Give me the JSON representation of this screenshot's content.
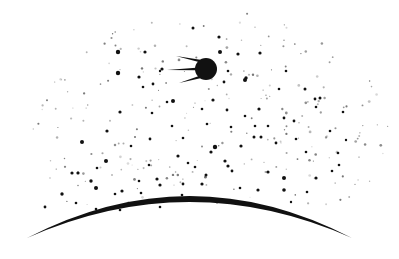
{
  "scene": {
    "width": 399,
    "height": 259,
    "background": "#ffffff",
    "ink_color": "#111111"
  },
  "satellite": {
    "name": "sputnik",
    "cx": 206,
    "cy": 69,
    "r": 11,
    "antennas": [
      {
        "x1": 200,
        "y1": 61,
        "x2": 176,
        "y2": 56
      },
      {
        "x1": 196,
        "y1": 69,
        "x2": 167,
        "y2": 70
      },
      {
        "x1": 200,
        "y1": 77,
        "x2": 179,
        "y2": 83
      }
    ]
  },
  "earth_horizon": {
    "x_left": 27,
    "x_right": 352,
    "y_ends": 238,
    "y_peak": 196,
    "thickness": 6
  },
  "stars_bright": [
    [
      118,
      52,
      2.2
    ],
    [
      145,
      52,
      1.6
    ],
    [
      162,
      69,
      1.6
    ],
    [
      143,
      87,
      1.3
    ],
    [
      118,
      73,
      2.2
    ],
    [
      139,
      77,
      1.6
    ],
    [
      153,
      84,
      1.4
    ],
    [
      160,
      71,
      1.2
    ],
    [
      173,
      101,
      2.0
    ],
    [
      193,
      28,
      1.5
    ],
    [
      219,
      37,
      1.6
    ],
    [
      220,
      52,
      2.0
    ],
    [
      238,
      54,
      1.6
    ],
    [
      260,
      53,
      1.6
    ],
    [
      246,
      78,
      1.7
    ],
    [
      245,
      80,
      2.0
    ],
    [
      224,
      82,
      1.4
    ],
    [
      228,
      71,
      1.3
    ],
    [
      286,
      71,
      1.3
    ],
    [
      305,
      89,
      1.5
    ],
    [
      320,
      98,
      1.5
    ],
    [
      315,
      99,
      1.4
    ],
    [
      279,
      89,
      1.3
    ],
    [
      213,
      100,
      1.6
    ],
    [
      227,
      110,
      1.4
    ],
    [
      202,
      109,
      1.3
    ],
    [
      259,
      109,
      1.6
    ],
    [
      316,
      107,
      1.3
    ],
    [
      284,
      118,
      1.4
    ],
    [
      294,
      121,
      1.4
    ],
    [
      120,
      112,
      1.6
    ],
    [
      82,
      142,
      2.0
    ],
    [
      107,
      131,
      1.6
    ],
    [
      106,
      161,
      2.0
    ],
    [
      72,
      173,
      1.6
    ],
    [
      78,
      173,
      1.6
    ],
    [
      96,
      188,
      2.0
    ],
    [
      122,
      191,
      1.6
    ],
    [
      215,
      147,
      2.2
    ],
    [
      225,
      161,
      1.6
    ],
    [
      228,
      166,
      1.6
    ],
    [
      241,
      146,
      1.6
    ],
    [
      206,
      175,
      1.5
    ],
    [
      202,
      184,
      1.6
    ],
    [
      232,
      171,
      1.4
    ],
    [
      268,
      172,
      1.6
    ],
    [
      284,
      178,
      2.0
    ],
    [
      316,
      178,
      1.6
    ],
    [
      258,
      190,
      1.6
    ],
    [
      217,
      202,
      1.4
    ],
    [
      160,
      185,
      1.6
    ],
    [
      157,
      179,
      1.6
    ],
    [
      183,
      184,
      1.4
    ],
    [
      284,
      190,
      1.8
    ],
    [
      62,
      194,
      1.7
    ],
    [
      91,
      181,
      1.7
    ],
    [
      45,
      207,
      1.4
    ],
    [
      76,
      203,
      1.3
    ],
    [
      115,
      194,
      1.3
    ],
    [
      141,
      193,
      1.3
    ],
    [
      182,
      195,
      1.3
    ],
    [
      240,
      188,
      1.3
    ],
    [
      307,
      192,
      1.3
    ],
    [
      254,
      137,
      1.5
    ],
    [
      261,
      137,
      1.5
    ],
    [
      276,
      143,
      1.4
    ],
    [
      296,
      139,
      1.3
    ],
    [
      306,
      152,
      1.3
    ],
    [
      178,
      156,
      1.6
    ],
    [
      188,
      163,
      1.3
    ],
    [
      195,
      167,
      1.3
    ],
    [
      211,
      152,
      1.6
    ],
    [
      150,
      139,
      1.4
    ],
    [
      172,
      126,
      1.3
    ],
    [
      183,
      138,
      1.3
    ],
    [
      207,
      124,
      1.3
    ],
    [
      231,
      127,
      1.3
    ],
    [
      255,
      126,
      1.3
    ],
    [
      131,
      146,
      1.3
    ],
    [
      152,
      113,
      1.3
    ],
    [
      167,
      102,
      1.3
    ],
    [
      97,
      168,
      1.3
    ],
    [
      149,
      165,
      1.3
    ],
    [
      139,
      181,
      1.3
    ],
    [
      245,
      116,
      1.3
    ],
    [
      268,
      126,
      1.3
    ],
    [
      343,
      112,
      1.3
    ],
    [
      330,
      131,
      1.3
    ],
    [
      338,
      153,
      1.3
    ],
    [
      339,
      165,
      1.3
    ],
    [
      332,
      171,
      1.3
    ],
    [
      346,
      140,
      1.2
    ],
    [
      120,
      210,
      1.3
    ],
    [
      96,
      209,
      1.3
    ],
    [
      160,
      207,
      1.3
    ],
    [
      291,
      202,
      1.2
    ]
  ],
  "stars_faint_seed": 1957,
  "stars_faint_count": 260,
  "stars_faint_region": {
    "cx": 210,
    "cy": 130,
    "rx": 180,
    "ry": 120
  }
}
